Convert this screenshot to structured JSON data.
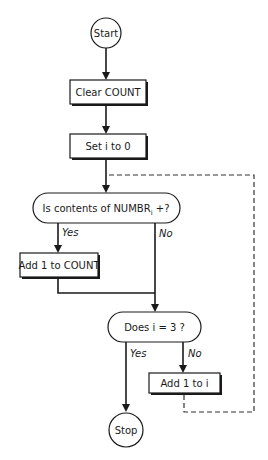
{
  "diagram": {
    "type": "flowchart",
    "colors": {
      "ink": "#1a1a1a",
      "background": "#ffffff",
      "loop_line": "#333333"
    },
    "nodes": {
      "start": {
        "shape": "circle",
        "label": "Start"
      },
      "clear_count": {
        "shape": "process",
        "label": "Clear COUNT"
      },
      "set_i": {
        "shape": "process",
        "label": "Set i to 0"
      },
      "decision_positive": {
        "shape": "decision",
        "label": "Is contents of NUMBR",
        "subscript": "i",
        "suffix": " +?"
      },
      "add_count": {
        "shape": "process",
        "label": "Add 1 to COUNT"
      },
      "decision_i3": {
        "shape": "decision",
        "label": "Does i = 3 ?"
      },
      "add_i": {
        "shape": "process",
        "label": "Add 1 to i"
      },
      "stop": {
        "shape": "circle",
        "label": "Stop"
      }
    },
    "edge_labels": {
      "positive_yes": "Yes",
      "positive_no": "No",
      "i3_yes": "Yes",
      "i3_no": "No"
    },
    "edges": [
      {
        "from": "start",
        "to": "clear_count"
      },
      {
        "from": "clear_count",
        "to": "set_i"
      },
      {
        "from": "set_i",
        "to": "decision_positive"
      },
      {
        "from": "decision_positive",
        "to": "add_count",
        "label": "Yes"
      },
      {
        "from": "decision_positive",
        "to": "decision_i3",
        "label": "No"
      },
      {
        "from": "add_count",
        "to": "decision_i3"
      },
      {
        "from": "decision_i3",
        "to": "stop",
        "label": "Yes"
      },
      {
        "from": "decision_i3",
        "to": "add_i",
        "label": "No"
      },
      {
        "from": "add_i",
        "to": "decision_positive",
        "style": "dashed"
      }
    ]
  }
}
